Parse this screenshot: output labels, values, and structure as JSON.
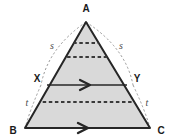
{
  "figure": {
    "type": "geometry-diagram",
    "shape": "triangle",
    "fill_color": "#d9d9d9",
    "stroke_color": "#262626",
    "dashed_color": "#3a3a3a",
    "arc_color": "#9a9a9a",
    "vertices": {
      "A": {
        "label": "A",
        "x": 86,
        "y": 22
      },
      "B": {
        "label": "B",
        "x": 25,
        "y": 128
      },
      "C": {
        "label": "C",
        "x": 150,
        "y": 128
      }
    },
    "points": {
      "X": {
        "label": "X",
        "x": 47,
        "y": 85
      },
      "Y": {
        "label": "Y",
        "x": 127,
        "y": 85
      }
    },
    "arc_labels": {
      "left_upper": "s",
      "right_upper": "s",
      "left_lower": "t",
      "right_lower": "t"
    },
    "dashed_lines": [
      {
        "name": "dashed-line-1",
        "y": 43
      },
      {
        "name": "dashed-line-2",
        "y": 57
      },
      {
        "name": "dashed-line-3",
        "y": 102
      }
    ],
    "arrow_lines": [
      {
        "name": "segment-xy",
        "y": 85
      },
      {
        "name": "segment-bc",
        "y": 128
      }
    ]
  }
}
